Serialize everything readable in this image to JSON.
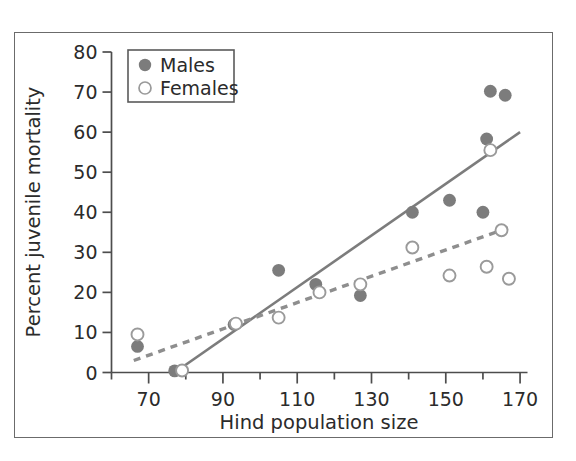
{
  "chart_data": {
    "type": "scatter",
    "title": "",
    "xlabel": "Hind population size",
    "ylabel": "Percent juvenile mortality",
    "xlim": [
      60,
      172
    ],
    "ylim": [
      0,
      80
    ],
    "grid": false,
    "legend_position": "top-left",
    "x_ticks": [
      70,
      90,
      110,
      130,
      150,
      170
    ],
    "x_minor_ticks": [
      60,
      80,
      100,
      120,
      140,
      160
    ],
    "y_ticks": [
      0,
      10,
      20,
      30,
      40,
      50,
      60,
      70,
      80
    ],
    "series": [
      {
        "name": "Males",
        "marker": "filled-circle",
        "color": "#7c7c7c",
        "points": [
          {
            "x": 67,
            "y": 6.5
          },
          {
            "x": 77,
            "y": 0.4
          },
          {
            "x": 93,
            "y": 12.0
          },
          {
            "x": 105,
            "y": 25.5
          },
          {
            "x": 115,
            "y": 22.0
          },
          {
            "x": 127,
            "y": 19.2
          },
          {
            "x": 141,
            "y": 40.0
          },
          {
            "x": 151,
            "y": 43.0
          },
          {
            "x": 160,
            "y": 40.0
          },
          {
            "x": 161,
            "y": 58.3
          },
          {
            "x": 162,
            "y": 70.2
          },
          {
            "x": 166,
            "y": 69.2
          }
        ],
        "trendline": {
          "style": "solid",
          "color": "#7c7c7c",
          "x_start": 77,
          "y_start": 0,
          "x_end": 170,
          "y_end": 60
        }
      },
      {
        "name": "Females",
        "marker": "open-circle",
        "color": "#9a9a9a",
        "points": [
          {
            "x": 67,
            "y": 9.5
          },
          {
            "x": 79,
            "y": 0.5
          },
          {
            "x": 93.5,
            "y": 12.2
          },
          {
            "x": 105,
            "y": 13.7
          },
          {
            "x": 116,
            "y": 20.0
          },
          {
            "x": 127,
            "y": 22.0
          },
          {
            "x": 141,
            "y": 31.2
          },
          {
            "x": 151,
            "y": 24.2
          },
          {
            "x": 161,
            "y": 26.4
          },
          {
            "x": 162,
            "y": 55.5
          },
          {
            "x": 165,
            "y": 35.5
          },
          {
            "x": 167,
            "y": 23.4
          }
        ],
        "trendline": {
          "style": "dashed",
          "color": "#8e8e8e",
          "x_start": 66,
          "y_start": 3.0,
          "x_end": 168,
          "y_end": 36.5
        }
      }
    ]
  },
  "legend": {
    "entries": [
      {
        "label": "Males",
        "marker": "filled-circle"
      },
      {
        "label": "Females",
        "marker": "open-circle"
      }
    ]
  },
  "colors": {
    "male_marker": "#7c7c7c",
    "female_marker_stroke": "#9a9a9a",
    "female_marker_fill": "#ffffff",
    "axis": "#4d4d4d",
    "text": "#2b2b2b",
    "frame": "#6b6b6b"
  }
}
